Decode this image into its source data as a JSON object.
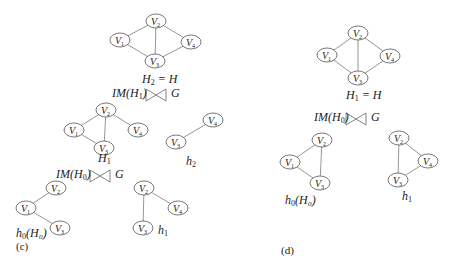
{
  "figure": {
    "panels": [
      {
        "id": "c",
        "letter": "(c)",
        "graphs": [
          {
            "name": "H2",
            "label_main": "H",
            "label_sub": "2",
            "label_suffix": " = H",
            "label_pos": [
              142,
              72
            ],
            "nodes": [
              {
                "id": "V1",
                "sub": "1",
                "x": 120,
                "y": 40
              },
              {
                "id": "V2",
                "sub": "2",
                "x": 156,
                "y": 21
              },
              {
                "id": "V3",
                "sub": "3",
                "x": 155,
                "y": 61
              },
              {
                "id": "V4",
                "sub": "4",
                "x": 191,
                "y": 42
              }
            ],
            "edges": [
              [
                "V1",
                "V2"
              ],
              [
                "V1",
                "V3"
              ],
              [
                "V2",
                "V3"
              ],
              [
                "V2",
                "V4"
              ],
              [
                "V3",
                "V4"
              ]
            ]
          },
          {
            "name": "H1",
            "label_main": "H",
            "label_sub": "1",
            "label_suffix": "",
            "label_pos": [
              98,
              151
            ],
            "nodes": [
              {
                "id": "V1",
                "sub": "1",
                "x": 74,
                "y": 130
              },
              {
                "id": "V2",
                "sub": "2",
                "x": 106,
                "y": 110
              },
              {
                "id": "V3",
                "sub": "3",
                "x": 104,
                "y": 148
              },
              {
                "id": "V4",
                "sub": "4",
                "x": 138,
                "y": 130
              }
            ],
            "edges": [
              [
                "V1",
                "V2"
              ],
              [
                "V1",
                "V3"
              ],
              [
                "V2",
                "V3"
              ],
              [
                "V2",
                "V4"
              ]
            ]
          },
          {
            "name": "h2",
            "label_main": "h",
            "label_sub": "2",
            "label_suffix": "",
            "label_pos": [
              186,
              154
            ],
            "nodes": [
              {
                "id": "V3",
                "sub": "3",
                "x": 176,
                "y": 142
              },
              {
                "id": "V4",
                "sub": "4",
                "x": 213,
                "y": 120
              }
            ],
            "edges": [
              [
                "V3",
                "V4"
              ]
            ]
          },
          {
            "name": "h0(H0)",
            "label_main": "h",
            "label_sub": "0",
            "label_suffix": "(H₀)",
            "label_pos": [
              16,
              226
            ],
            "nodes": [
              {
                "id": "V1",
                "sub": "1",
                "x": 26,
                "y": 208
              },
              {
                "id": "V2",
                "sub": "2",
                "x": 56,
                "y": 188
              },
              {
                "id": "V3",
                "sub": "3",
                "x": 60,
                "y": 228
              }
            ],
            "edges": [
              [
                "V1",
                "V2"
              ],
              [
                "V1",
                "V3"
              ]
            ]
          },
          {
            "name": "h1",
            "label_main": "h",
            "label_sub": "1",
            "label_suffix": "",
            "label_pos": [
              158,
              223
            ],
            "nodes": [
              {
                "id": "V2",
                "sub": "2",
                "x": 144,
                "y": 188
              },
              {
                "id": "V3",
                "sub": "3",
                "x": 143,
                "y": 228
              },
              {
                "id": "V4",
                "sub": "4",
                "x": 178,
                "y": 208
              }
            ],
            "edges": [
              [
                "V2",
                "V3"
              ],
              [
                "V2",
                "V4"
              ]
            ]
          }
        ],
        "relations": [
          {
            "left": "IM(H",
            "sub": "1",
            "right": ")",
            "target": "G",
            "x": 112,
            "y": 86,
            "bowtie_x": 146
          },
          {
            "left": "IM(H",
            "sub": "0",
            "right": ")",
            "target": "G",
            "x": 56,
            "y": 167,
            "bowtie_x": 90
          }
        ],
        "letter_pos": [
          16,
          240
        ]
      },
      {
        "id": "d",
        "letter": "(d)",
        "graphs": [
          {
            "name": "H1",
            "label_main": "H",
            "label_sub": "1",
            "label_suffix": " = H",
            "label_pos": [
              346,
              88
            ],
            "nodes": [
              {
                "id": "V1",
                "sub": "1",
                "x": 327,
                "y": 55
              },
              {
                "id": "V2",
                "sub": "2",
                "x": 358,
                "y": 33
              },
              {
                "id": "V3",
                "sub": "3",
                "x": 358,
                "y": 78
              },
              {
                "id": "V4",
                "sub": "4",
                "x": 390,
                "y": 56
              }
            ],
            "edges": [
              [
                "V1",
                "V2"
              ],
              [
                "V1",
                "V3"
              ],
              [
                "V2",
                "V3"
              ],
              [
                "V2",
                "V4"
              ],
              [
                "V3",
                "V4"
              ]
            ]
          },
          {
            "name": "h0(H0)",
            "label_main": "h",
            "label_sub": "0",
            "label_suffix": "(H₀)",
            "label_pos": [
              285,
              193
            ],
            "nodes": [
              {
                "id": "V1",
                "sub": "1",
                "x": 290,
                "y": 162
              },
              {
                "id": "V2",
                "sub": "2",
                "x": 322,
                "y": 140
              },
              {
                "id": "V3",
                "sub": "3",
                "x": 320,
                "y": 183
              }
            ],
            "edges": [
              [
                "V1",
                "V2"
              ],
              [
                "V1",
                "V3"
              ],
              [
                "V2",
                "V3"
              ]
            ]
          },
          {
            "name": "h1",
            "label_main": "h",
            "label_sub": "1",
            "label_suffix": "",
            "label_pos": [
              402,
              189
            ],
            "nodes": [
              {
                "id": "V2",
                "sub": "2",
                "x": 399,
                "y": 138
              },
              {
                "id": "V3",
                "sub": "3",
                "x": 398,
                "y": 180
              },
              {
                "id": "V4",
                "sub": "4",
                "x": 428,
                "y": 161
              }
            ],
            "edges": [
              [
                "V2",
                "V3"
              ],
              [
                "V2",
                "V4"
              ],
              [
                "V3",
                "V4"
              ]
            ]
          }
        ],
        "relations": [
          {
            "left": "IM(H",
            "sub": "0",
            "right": ")",
            "target": "G",
            "x": 314,
            "y": 110,
            "bowtie_x": 346
          }
        ],
        "letter_pos": [
          281,
          244
        ]
      }
    ]
  }
}
